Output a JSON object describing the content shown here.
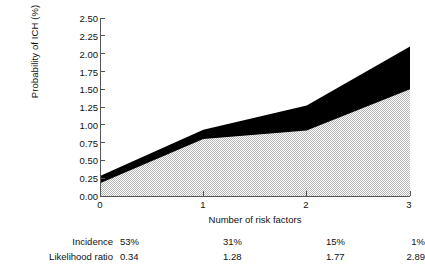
{
  "chart_data": {
    "type": "area",
    "title": "",
    "xlabel": "Number of risk factors",
    "ylabel": "Probability of ICH (%)",
    "x": [
      0,
      1,
      2,
      3
    ],
    "xticklabels": [
      "0",
      "1",
      "2",
      "3"
    ],
    "yticklabels": [
      "0.00",
      "0.25",
      "0.50",
      "0.75",
      "1.00",
      "1.25",
      "1.50",
      "1.75",
      "2.00",
      "2.25",
      "2.50"
    ],
    "ytickvalues": [
      0.0,
      0.25,
      0.5,
      0.75,
      1.0,
      1.25,
      1.5,
      1.75,
      2.0,
      2.25,
      2.5
    ],
    "xlim": [
      0,
      3
    ],
    "ylim": [
      0.0,
      2.5
    ],
    "grid": false,
    "legend": "none",
    "series": [
      {
        "name": "upper-bound",
        "fill": "#000000",
        "values": [
          0.28,
          0.93,
          1.27,
          2.1
        ]
      },
      {
        "name": "point-estimate",
        "fill": "#d9d9d9",
        "pattern": "stipple",
        "values": [
          0.18,
          0.8,
          0.92,
          1.5
        ]
      }
    ]
  },
  "table": {
    "rows": [
      {
        "label": "Incidence",
        "values": [
          "53%",
          "31%",
          "15%",
          "1%"
        ]
      },
      {
        "label": "Likelihood ratio",
        "values": [
          "0.34",
          "1.28",
          "1.77",
          "2.89"
        ]
      }
    ]
  },
  "colors": {
    "axis": "#555555",
    "band_upper": "#000000",
    "band_lower": "#d9d9d9",
    "text": "#111111",
    "background": "#ffffff"
  }
}
